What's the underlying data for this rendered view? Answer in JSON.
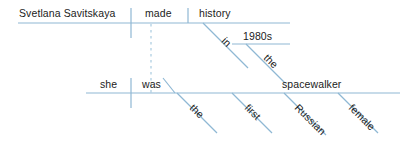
{
  "diagram": {
    "type": "reed-kellogg-sentence-diagram",
    "sentence": "Svetlana Savitskaya made history in the 1980s; she was the first Russian female spacewalker.",
    "line_color": "#8fb8d4",
    "text_color": "#1b1b1b",
    "background": "#ffffff",
    "main_clause": {
      "subject": "Svetlana Savitskaya",
      "verb": "made",
      "object": "history"
    },
    "prepositional_phrase": {
      "preposition": "in",
      "article": "the",
      "object": "1980s"
    },
    "subordinate_clause": {
      "subject": "she",
      "verb": "was",
      "complement": "spacewalker",
      "modifiers": [
        "the",
        "first",
        "Russian",
        "female"
      ]
    },
    "labels": {
      "subject_main": "Svetlana Savitskaya",
      "verb_main": "made",
      "object_main": "history",
      "prep_in": "in",
      "prep_the": "the",
      "prep_object": "1980s",
      "subject_sub": "she",
      "verb_sub": "was",
      "complement_sub": "spacewalker",
      "mod_the": "the",
      "mod_first": "first",
      "mod_russian": "Russian",
      "mod_female": "female"
    }
  }
}
